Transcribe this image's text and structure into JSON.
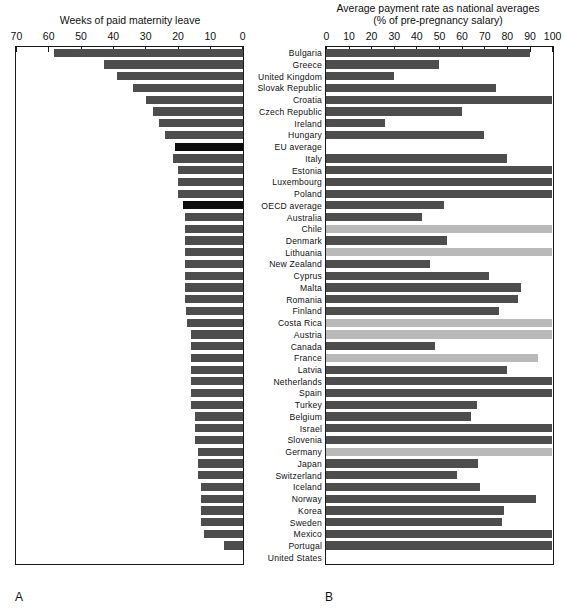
{
  "figure": {
    "panel_a_letter": "A",
    "panel_b_letter": "B"
  },
  "panel_a": {
    "title": "Weeks of paid maternity leave",
    "axis_ticks": [
      70,
      60,
      50,
      40,
      30,
      20,
      10,
      0
    ],
    "axis_min": 0,
    "axis_max": 70,
    "axis_reversed": true
  },
  "panel_b": {
    "title_line1": "Average payment rate as national averages",
    "title_line2": "(% of pre-pregnancy salary)",
    "axis_ticks": [
      0,
      10,
      20,
      30,
      40,
      50,
      60,
      70,
      80,
      90,
      100
    ],
    "axis_min": 0,
    "axis_max": 100,
    "axis_reversed": false
  },
  "colors": {
    "bar_dark": "#4d4d4d",
    "bar_black": "#0d0d0d",
    "bar_light": "#b9b9b9",
    "axis": "#1a1a1a",
    "background": "#ffffff"
  },
  "chart_data": {
    "type": "bar",
    "orientation": "horizontal",
    "categories": [
      "Bulgaria",
      "Greece",
      "United Kingdom",
      "Slovak Republic",
      "Croatia",
      "Czech Republic",
      "Ireland",
      "Hungary",
      "EU average",
      "Italy",
      "Estonia",
      "Luxembourg",
      "Poland",
      "OECD average",
      "Australia",
      "Chile",
      "Denmark",
      "Lithuania",
      "New Zealand",
      "Cyprus",
      "Malta",
      "Romania",
      "Finland",
      "Costa Rica",
      "Austria",
      "Canada",
      "France",
      "Latvia",
      "Netherlands",
      "Spain",
      "Turkey",
      "Belgium",
      "Israel",
      "Slovenia",
      "Germany",
      "Japan",
      "Switzerland",
      "Iceland",
      "Norway",
      "Korea",
      "Sweden",
      "Mexico",
      "Portugal",
      "United States"
    ],
    "series": [
      {
        "name": "Weeks of paid maternity leave",
        "panel": "A",
        "xlabel": "Weeks of paid maternity leave",
        "xlim": [
          0,
          70
        ],
        "axis_reversed": true,
        "values": [
          58.6,
          43.0,
          39.0,
          34.0,
          30.0,
          28.0,
          26.0,
          24.0,
          21.1,
          21.7,
          20.0,
          20.0,
          20.0,
          18.5,
          18.0,
          18.0,
          18.0,
          18.0,
          18.0,
          18.0,
          18.0,
          18.0,
          17.5,
          17.3,
          16.0,
          16.0,
          16.0,
          16.0,
          16.0,
          16.0,
          16.0,
          15.0,
          15.0,
          15.0,
          14.0,
          14.0,
          14.0,
          13.0,
          13.0,
          12.9,
          12.9,
          12.0,
          6.0,
          0.0
        ],
        "highlight_indices": [
          8,
          13
        ],
        "highlight_color": "#0d0d0d"
      },
      {
        "name": "Average payment rate as national averages (% of pre-pregnancy salary)",
        "panel": "B",
        "xlabel": "Average payment rate as national averages (% of pre-pregnancy salary)",
        "xlim": [
          0,
          100
        ],
        "axis_reversed": false,
        "values": [
          90.0,
          49.9,
          30.0,
          75.0,
          100.0,
          60.0,
          26.0,
          70.0,
          0.0,
          80.0,
          100.0,
          100.0,
          100.0,
          52.3,
          42.6,
          100.0,
          53.6,
          100.0,
          45.9,
          72.0,
          86.0,
          85.0,
          76.3,
          100.0,
          100.0,
          48.0,
          93.8,
          80.0,
          100.0,
          100.0,
          66.7,
          64.0,
          100.0,
          100.0,
          100.0,
          67.0,
          58.0,
          68.0,
          93.0,
          78.6,
          77.6,
          100.0,
          100.0,
          0.0
        ],
        "light_indices": [
          15,
          17,
          23,
          24,
          26,
          34
        ],
        "light_color": "#b9b9b9"
      }
    ],
    "grid": false,
    "legend": null
  }
}
